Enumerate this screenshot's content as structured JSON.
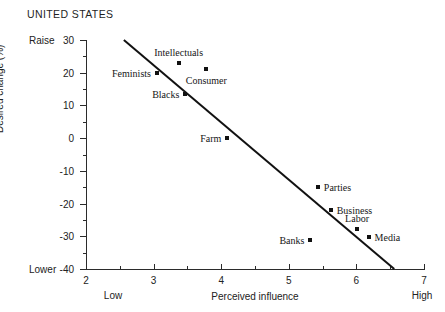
{
  "chart_data": {
    "type": "scatter",
    "title": "UNITED STATES",
    "xlabel": "Perceived influence",
    "ylabel": "Desired change (%)",
    "xlim": [
      2,
      7
    ],
    "ylim": [
      -40,
      30
    ],
    "x_ticks": [
      2,
      3,
      4,
      5,
      6,
      7
    ],
    "x_tick_labels": [
      "2",
      "3",
      "4",
      "5",
      "6",
      "7"
    ],
    "x_minor_ticks": [
      2.5,
      3.5,
      4.5,
      5.5,
      6.5
    ],
    "y_ticks": [
      30,
      20,
      10,
      0,
      -10,
      -20,
      -30,
      -40
    ],
    "y_tick_labels": [
      "30",
      "20",
      "10",
      "0",
      "-10",
      "-20",
      "-30",
      "-40"
    ],
    "y_minor_ticks": [
      25,
      15,
      5,
      -5,
      -15,
      -25,
      -35
    ],
    "grid": false,
    "legend": "none",
    "axis_end_labels": {
      "y_top": "Raise",
      "y_bottom": "Lower",
      "x_left": "Low",
      "x_right": "High"
    },
    "points": [
      {
        "label": "Feminists",
        "x": 3.05,
        "y": 20.0,
        "label_pos": "left"
      },
      {
        "label": "Intellectuals",
        "x": 3.37,
        "y": 23.0,
        "label_pos": "above"
      },
      {
        "label": "Consumer",
        "x": 3.78,
        "y": 21.0,
        "label_pos": "below"
      },
      {
        "label": "Blacks",
        "x": 3.47,
        "y": 13.5,
        "label_pos": "left"
      },
      {
        "label": "Farm",
        "x": 4.09,
        "y": 0.0,
        "label_pos": "left"
      },
      {
        "label": "Parties",
        "x": 5.43,
        "y": -15.0,
        "label_pos": "right"
      },
      {
        "label": "Business",
        "x": 5.62,
        "y": -22.0,
        "label_pos": "right"
      },
      {
        "label": "Labor",
        "x": 6.01,
        "y": -27.8,
        "label_pos": "above"
      },
      {
        "label": "Media",
        "x": 6.18,
        "y": -30.2,
        "label_pos": "right"
      },
      {
        "label": "Banks",
        "x": 5.32,
        "y": -31.0,
        "label_pos": "left"
      }
    ],
    "trend_line": {
      "x_start": 2.56,
      "y_start": 30.0,
      "x_end": 6.56,
      "y_end": -40.0,
      "slope": -17.5,
      "intercept": 74.8,
      "color": "#111111",
      "width": 2.0
    }
  }
}
